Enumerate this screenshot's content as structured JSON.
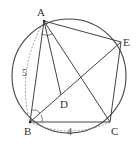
{
  "diagram": {
    "colors": {
      "line": "#444444",
      "dashed": "#888888",
      "background": "#ffffff"
    },
    "circle": {
      "cx": 69,
      "cy": 76,
      "r": 57
    },
    "points": {
      "A": {
        "label": "A",
        "x": 44,
        "y": 21
      },
      "B": {
        "label": "B",
        "x": 30,
        "y": 122
      },
      "C": {
        "label": "C",
        "x": 110,
        "y": 122
      },
      "D": {
        "label": "D",
        "x": 61,
        "y": 95
      },
      "E": {
        "label": "E",
        "x": 121,
        "y": 42
      }
    },
    "measurements": {
      "AB": "5",
      "BC": "4"
    }
  }
}
